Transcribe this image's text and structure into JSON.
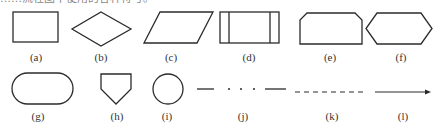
{
  "top_text_fragment": "……流程图中使用的各种符号。",
  "figures": [
    {
      "id": "a",
      "label": "(a)",
      "shape": "rectangle"
    },
    {
      "id": "b",
      "label": "(b)",
      "shape": "diamond"
    },
    {
      "id": "c",
      "label": "(c)",
      "shape": "parallelogram"
    },
    {
      "id": "d",
      "label": "(d)",
      "shape": "predefined-process-rectangle"
    },
    {
      "id": "e",
      "label": "(e)",
      "shape": "chamfered-top-rectangle"
    },
    {
      "id": "f",
      "label": "(f)",
      "shape": "hexagon"
    },
    {
      "id": "g",
      "label": "(g)",
      "shape": "rounded-terminator"
    },
    {
      "id": "h",
      "label": "(h)",
      "shape": "pentagon-offpage-connector"
    },
    {
      "id": "i",
      "label": "(i)",
      "shape": "circle-connector"
    },
    {
      "id": "j",
      "label": "(j)",
      "shape": "dash-dot-line"
    },
    {
      "id": "k",
      "label": "(k)",
      "shape": "dashed-line"
    },
    {
      "id": "l",
      "label": "(l)",
      "shape": "arrow-line"
    }
  ],
  "colors": {
    "stroke": "#2b2b2b",
    "text": "#333333",
    "background": "#ffffff"
  }
}
